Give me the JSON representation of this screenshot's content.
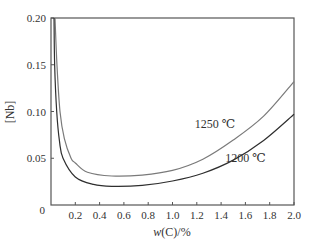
{
  "chart_data": {
    "type": "line",
    "title": "",
    "xlabel": "w(C)/%",
    "xlabel_parts": {
      "italic": "w",
      "rest": "(C)/%"
    },
    "ylabel": "[Nb]",
    "xlim": [
      0,
      2.0
    ],
    "ylim": [
      0,
      0.2
    ],
    "xticks": [
      0.2,
      0.4,
      0.6,
      0.8,
      1.0,
      1.2,
      1.4,
      1.6,
      1.8,
      2.0
    ],
    "xtick_labels": [
      "0.2",
      "0.4",
      "0.6",
      "0.8",
      "1.0",
      "1.2",
      "1.4",
      "1.6",
      "1.8",
      "2.0"
    ],
    "yticks": [
      0,
      0.05,
      0.1,
      0.15,
      0.2
    ],
    "ytick_labels": [
      "0",
      "0.05",
      "0.10",
      "0.15",
      "0.20"
    ],
    "grid": false,
    "legend": "inline labels",
    "series": [
      {
        "name": "1250 ℃",
        "color": "#7a7a7a",
        "label_pos": [
          1.35,
          0.082
        ],
        "x": [
          0.033,
          0.049,
          0.074,
          0.11,
          0.165,
          0.2,
          0.3,
          0.5,
          0.75,
          1.0,
          1.25,
          1.5,
          1.75,
          2.0
        ],
        "values": [
          0.2,
          0.15,
          0.1,
          0.071,
          0.05,
          0.045,
          0.035,
          0.031,
          0.032,
          0.037,
          0.049,
          0.0695,
          0.095,
          0.132
        ]
      },
      {
        "name": "1200 ℃",
        "color": "#2e2e2e",
        "label_pos": [
          1.6,
          0.046
        ],
        "x": [
          0.025,
          0.03,
          0.047,
          0.07,
          0.099,
          0.2,
          0.35,
          0.5,
          0.75,
          1.0,
          1.25,
          1.5,
          1.75,
          2.0
        ],
        "values": [
          0.2,
          0.15,
          0.1,
          0.068,
          0.05,
          0.03,
          0.022,
          0.02,
          0.021,
          0.0257,
          0.034,
          0.048,
          0.069,
          0.097
        ]
      }
    ]
  },
  "colors": {
    "axis": "#555555",
    "text": "#333333"
  }
}
